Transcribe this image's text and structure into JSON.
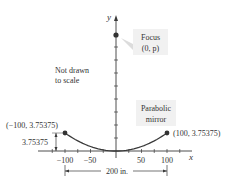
{
  "diagram": {
    "title": "Parabolic mirror",
    "axes": {
      "x_label": "x",
      "y_label": "y",
      "x_tick_labels": [
        "−100",
        "−50",
        "50",
        "100"
      ],
      "x_ticks": [
        -125,
        -100,
        -75,
        -50,
        -25,
        25,
        50,
        75,
        100,
        125
      ],
      "y_tick_count": 9
    },
    "focus": {
      "label_line1": "Focus",
      "label_line2": "(0, p)"
    },
    "note": {
      "line1": "Not drawn",
      "line2": "to scale"
    },
    "mirror": {
      "label_line1": "Parabolic",
      "label_line2": "mirror",
      "left_point": {
        "x": -100,
        "y": 3.75375,
        "label": "(−100, 3.75375)"
      },
      "right_point": {
        "x": 100,
        "y": 3.75375,
        "label": "(100, 3.75375)"
      }
    },
    "depth_label": "3.75375",
    "width_label": "200 in.",
    "colors": {
      "curve": "#3a3a3a",
      "axis": "#3a3a3a",
      "callout_bg": "#f1f1f1",
      "callout_pointer": "#dcdcdc",
      "point": "#333333"
    }
  }
}
